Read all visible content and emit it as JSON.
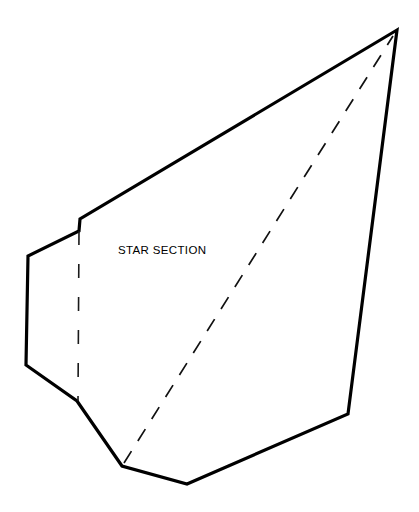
{
  "canvas": {
    "width": 419,
    "height": 512,
    "background_color": "#ffffff"
  },
  "diagram": {
    "label": "STAR SECTION",
    "label_position": {
      "x": 118,
      "y": 254
    },
    "line_color": "#000000",
    "outline_stroke_width": 3.2,
    "dash_color": "#111111",
    "dash_stroke_width": 1.7
  },
  "chart_data": {
    "type": "diagram",
    "title": "STAR SECTION",
    "xlabel": "",
    "ylabel": "",
    "annotations": [
      {
        "text": "STAR SECTION",
        "x": 118,
        "y": 254
      }
    ],
    "shapes": [
      {
        "name": "section-outline",
        "kind": "polygon",
        "closed": true,
        "style": "solid",
        "stroke": "#000000",
        "stroke_width": 3.2,
        "fill": "none",
        "points": [
          [
            397,
            30
          ],
          [
            80,
            219
          ],
          [
            79,
            231
          ],
          [
            28,
            256
          ],
          [
            26,
            365
          ],
          [
            77,
            401
          ],
          [
            122,
            466
          ],
          [
            187,
            484
          ],
          [
            348,
            414
          ],
          [
            397,
            30
          ]
        ]
      },
      {
        "name": "vertical-hidden-line",
        "kind": "polyline",
        "closed": false,
        "style": "dashed",
        "stroke": "#1a1a1a",
        "stroke_width": 1.6,
        "dash_length": 14,
        "gap_length": 19,
        "points": [
          [
            79,
            231
          ],
          [
            78,
            401
          ]
        ]
      },
      {
        "name": "diagonal-hidden-line",
        "kind": "polyline",
        "closed": false,
        "style": "dashed",
        "stroke": "#111111",
        "stroke_width": 1.7,
        "dash_length": 14,
        "gap_length": 12,
        "points": [
          [
            124,
            463
          ],
          [
            393,
            36
          ]
        ]
      }
    ],
    "grid": false,
    "legend": null
  }
}
